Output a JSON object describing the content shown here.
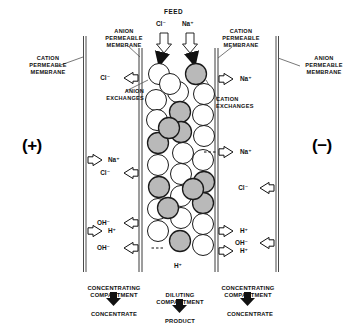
{
  "diagram": {
    "colors": {
      "ink": "#111111",
      "membrane": "#444444",
      "anion_bead": "#ffffff",
      "cation_bead": "#b9b9b9",
      "bead_outline": "#1a1a1a"
    },
    "feed": {
      "title": "FEED",
      "ions": [
        "Cl⁻",
        "Na⁺"
      ]
    },
    "electrodes": {
      "anode": "(+)",
      "cathode": "(−)"
    },
    "membranes": [
      {
        "id": "outer-left",
        "label": "CATION\nPERMEABLE\nMEMBRANE"
      },
      {
        "id": "inner-left",
        "label": "ANION\nPERMEABLE\nMEMBRANE"
      },
      {
        "id": "inner-right",
        "label": "CATION\nPERMEABLE\nMEMBRANE"
      },
      {
        "id": "outer-right",
        "label": "ANION\nPERMEABLE\nMEMBRANE"
      }
    ],
    "resin_labels": {
      "anion": "ANION\nEXCHANGES",
      "cation": "CATION\nEXCHANGES"
    },
    "ion_flows": [
      {
        "id": "outer-left-na",
        "ion": "Na⁺",
        "direction": "right"
      },
      {
        "id": "outer-left-h",
        "ion": "H⁺",
        "direction": "right"
      },
      {
        "id": "inner-left-cl-1",
        "ion": "Cl⁻",
        "direction": "left"
      },
      {
        "id": "inner-left-cl-2",
        "ion": "Cl⁻",
        "direction": "left"
      },
      {
        "id": "inner-left-oh-1",
        "ion": "OH⁻",
        "direction": "left"
      },
      {
        "id": "inner-left-oh-2",
        "ion": "OH⁻",
        "direction": "left"
      },
      {
        "id": "inner-right-na-1",
        "ion": "Na⁺",
        "direction": "right"
      },
      {
        "id": "inner-right-na-2",
        "ion": "Na⁺",
        "direction": "right"
      },
      {
        "id": "inner-right-h-1",
        "ion": "H⁺",
        "direction": "right"
      },
      {
        "id": "inner-right-h-2",
        "ion": "H⁺",
        "direction": "right"
      },
      {
        "id": "outer-right-cl",
        "ion": "Cl⁻",
        "direction": "left"
      },
      {
        "id": "outer-right-oh",
        "ion": "OH⁻",
        "direction": "left"
      },
      {
        "id": "bed-bottom-h",
        "ion": "H⁺",
        "direction": "none"
      }
    ],
    "compartments": [
      {
        "id": "left",
        "name": "CONCENTRATING\nCOMPARTMENT",
        "output": "CONCENTRATE"
      },
      {
        "id": "center",
        "name": "DILUTING\nCOMPARTMENT",
        "output": "PRODUCT"
      },
      {
        "id": "right",
        "name": "CONCENTRATING\nCOMPARTMENT",
        "output": "CONCENTRATE"
      }
    ],
    "resin_bed": {
      "anion_bead_count": 18,
      "cation_bead_count": 11,
      "beads": [
        {
          "cx": 159,
          "cy": 74,
          "r": 10.5,
          "type": "anion"
        },
        {
          "cx": 196,
          "cy": 74,
          "r": 10.5,
          "type": "cation"
        },
        {
          "cx": 178,
          "cy": 92,
          "r": 10.5,
          "type": "anion"
        },
        {
          "cx": 204,
          "cy": 94,
          "r": 10.5,
          "type": "anion"
        },
        {
          "cx": 156,
          "cy": 100,
          "r": 10.5,
          "type": "anion"
        },
        {
          "cx": 180,
          "cy": 112,
          "r": 10.5,
          "type": "cation"
        },
        {
          "cx": 203,
          "cy": 115,
          "r": 10.5,
          "type": "anion"
        },
        {
          "cx": 157,
          "cy": 120,
          "r": 10.5,
          "type": "anion"
        },
        {
          "cx": 181,
          "cy": 132,
          "r": 10.5,
          "type": "cation"
        },
        {
          "cx": 204,
          "cy": 136,
          "r": 10.5,
          "type": "anion"
        },
        {
          "cx": 158,
          "cy": 143,
          "r": 10.5,
          "type": "cation"
        },
        {
          "cx": 183,
          "cy": 153,
          "r": 10.5,
          "type": "anion"
        },
        {
          "cx": 158,
          "cy": 165,
          "r": 10.5,
          "type": "anion"
        },
        {
          "cx": 203,
          "cy": 160,
          "r": 10.5,
          "type": "anion"
        },
        {
          "cx": 181,
          "cy": 174,
          "r": 10.5,
          "type": "anion"
        },
        {
          "cx": 204,
          "cy": 182,
          "r": 10.5,
          "type": "cation"
        },
        {
          "cx": 159,
          "cy": 187,
          "r": 10.5,
          "type": "cation"
        },
        {
          "cx": 181,
          "cy": 196,
          "r": 10.5,
          "type": "anion"
        },
        {
          "cx": 203,
          "cy": 203,
          "r": 10.5,
          "type": "cation"
        },
        {
          "cx": 158,
          "cy": 209,
          "r": 10.5,
          "type": "anion"
        },
        {
          "cx": 181,
          "cy": 218,
          "r": 10.5,
          "type": "anion"
        },
        {
          "cx": 203,
          "cy": 224,
          "r": 10.5,
          "type": "anion"
        },
        {
          "cx": 158,
          "cy": 231,
          "r": 10.5,
          "type": "anion"
        },
        {
          "cx": 180,
          "cy": 241,
          "r": 10.5,
          "type": "cation"
        },
        {
          "cx": 203,
          "cy": 245,
          "r": 10.5,
          "type": "anion"
        },
        {
          "cx": 170,
          "cy": 84,
          "r": 10.5,
          "type": "anion"
        },
        {
          "cx": 168,
          "cy": 208,
          "r": 10.5,
          "type": "cation"
        },
        {
          "cx": 193,
          "cy": 189,
          "r": 10.5,
          "type": "cation"
        },
        {
          "cx": 169,
          "cy": 128,
          "r": 10.5,
          "type": "cation"
        }
      ]
    }
  }
}
